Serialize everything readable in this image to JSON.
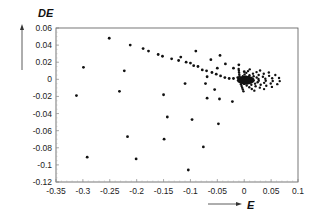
{
  "chart_data": {
    "type": "scatter",
    "title": "",
    "xlabel": "E",
    "ylabel": "DE",
    "xlim": [
      -0.35,
      0.1
    ],
    "ylim": [
      -0.12,
      0.06
    ],
    "grid": false,
    "legend": null,
    "x_ticks": [
      "-0.35",
      "-0.3",
      "-0.25",
      "-0.2",
      "-0.15",
      "-0.1",
      "-0.05",
      "0",
      "0.05",
      "0.1"
    ],
    "y_ticks": [
      "0.06",
      "0.04",
      "0.02",
      "0",
      "-0.02",
      "-0.04",
      "-0.06",
      "-0.08",
      "-0.1",
      "-0.12"
    ],
    "series": [
      {
        "name": "trajectory",
        "points": [
          [
            -0.251,
            0.048
          ],
          [
            -0.212,
            0.04
          ],
          [
            -0.188,
            0.036
          ],
          [
            -0.178,
            0.033
          ],
          [
            -0.16,
            0.029
          ],
          [
            -0.152,
            0.027
          ],
          [
            -0.135,
            0.024
          ],
          [
            -0.122,
            0.022
          ],
          [
            -0.118,
            0.026
          ],
          [
            -0.108,
            0.02
          ],
          [
            -0.1,
            0.019
          ],
          [
            -0.094,
            0.016
          ],
          [
            -0.086,
            0.015
          ],
          [
            -0.078,
            0.011
          ],
          [
            -0.07,
            0.01
          ],
          [
            -0.06,
            0.008
          ],
          [
            -0.052,
            0.006
          ],
          [
            -0.044,
            0.004
          ],
          [
            -0.036,
            0.002
          ],
          [
            -0.028,
            0.001
          ],
          [
            -0.02,
            0.001
          ],
          [
            -0.012,
            0.002
          ],
          [
            -0.09,
            0.033
          ],
          [
            -0.062,
            0.023
          ],
          [
            -0.045,
            0.028
          ],
          [
            -0.035,
            0.018
          ],
          [
            -0.05,
            0.013
          ],
          [
            -0.02,
            0.013
          ],
          [
            -0.01,
            0.017
          ],
          [
            0.0,
            0.009
          ],
          [
            -0.299,
            0.014
          ],
          [
            -0.223,
            0.01
          ],
          [
            -0.312,
            -0.019
          ],
          [
            -0.232,
            -0.014
          ],
          [
            -0.143,
            -0.044
          ],
          [
            -0.097,
            -0.047
          ],
          [
            -0.217,
            -0.067
          ],
          [
            -0.149,
            -0.07
          ],
          [
            -0.292,
            -0.091
          ],
          [
            -0.201,
            -0.093
          ],
          [
            -0.104,
            -0.106
          ],
          [
            -0.069,
            0.003
          ],
          [
            -0.072,
            -0.005
          ],
          [
            -0.069,
            -0.022
          ],
          [
            -0.046,
            -0.023
          ],
          [
            -0.022,
            -0.026
          ],
          [
            -0.048,
            -0.052
          ],
          [
            -0.076,
            -0.079
          ],
          [
            -0.15,
            -0.018
          ],
          [
            -0.11,
            -0.005
          ],
          [
            -0.055,
            -0.012
          ]
        ],
        "spiral_center": [
          0.0,
          0.0
        ],
        "note": "dense spiral of points converging near (0, 0) with arcs extending to E≈0.07"
      }
    ]
  }
}
